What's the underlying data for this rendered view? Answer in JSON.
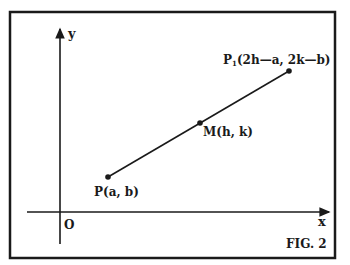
{
  "figure": {
    "caption": "FIG. 2",
    "axes": {
      "x_label": "x",
      "y_label": "y",
      "origin_label": "O"
    },
    "points": {
      "P": {
        "name": "P",
        "label": "P(a, b)"
      },
      "M": {
        "name": "M",
        "label": "M(h, k)"
      },
      "P1": {
        "name": "P",
        "subscript": "1",
        "coords": "(2h—a, 2k—b)"
      }
    },
    "colors": {
      "ink": "#1a1a1a",
      "background": "#ffffff"
    }
  }
}
